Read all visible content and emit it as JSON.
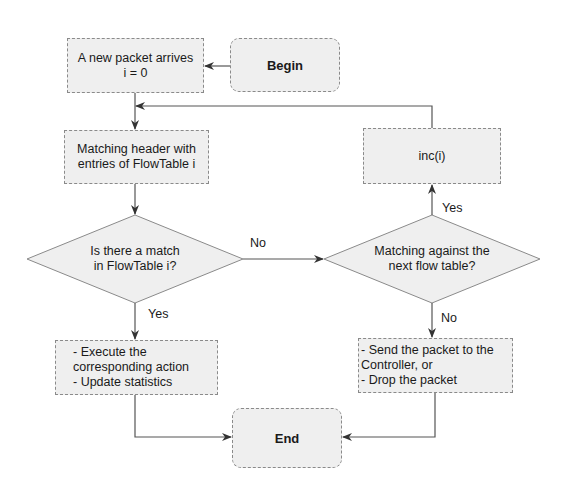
{
  "diagram": {
    "nodes": {
      "begin": "Begin",
      "new_packet": "A new packet arrives\ni = 0",
      "matching_header": "Matching header with\nentries of FlowTable i",
      "decision_match": "Is there a match\nin FlowTable i?",
      "decision_next": "Matching against the\nnext flow table?",
      "inc": "inc(i)",
      "execute": "- Execute the\ncorresponding action\n- Update statistics",
      "send_drop": "- Send the packet to the\nController, or\n- Drop the packet",
      "end": "End"
    },
    "edge_labels": {
      "match_no": "No",
      "match_yes": "Yes",
      "next_yes": "Yes",
      "next_no": "No"
    },
    "colors": {
      "fill": "#efefef",
      "stroke": "#8a8a8a",
      "line": "#555555"
    }
  }
}
